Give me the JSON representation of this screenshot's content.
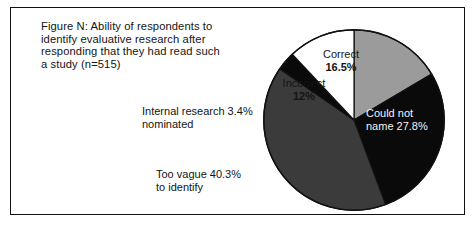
{
  "figure": {
    "title_lines": [
      "Figure N: Ability of respondents to",
      "identify evaluative research after",
      "responding that they had read such",
      "a study (n=515)"
    ]
  },
  "chart_data": {
    "type": "pie",
    "title": "Figure N: Ability of respondents to identify evaluative research after responding that they had read such a study (n=515)",
    "total_respondents": 515,
    "start_angle_deg": 0,
    "direction": "clockwise",
    "legend": "none",
    "categories": [
      "Correct",
      "Could not name",
      "Too vague to identify",
      "Internal research nominated",
      "Incorrect"
    ],
    "values": [
      16.5,
      27.8,
      40.3,
      3.4,
      12
    ],
    "unit": "%",
    "colors": [
      "#9b9b9b",
      "#0a0a0a",
      "#3b3b3b",
      "#0a0a0a",
      "#ffffff"
    ],
    "slices": [
      {
        "name": "Correct",
        "value": 16.5,
        "label_line1": "Correct",
        "label_line2": "16.5%",
        "color": "#9b9b9b",
        "text_color": "#141414",
        "label_placement": "inside"
      },
      {
        "name": "Could not name",
        "value": 27.8,
        "label_line1": "Could not",
        "label_line2": "name 27.8%",
        "color": "#0a0a0a",
        "text_color": "#f2f2f2",
        "label_placement": "inside"
      },
      {
        "name": "Too vague to identify",
        "value": 40.3,
        "label_line1": "Too vague 40.3%",
        "label_line2": "to identify",
        "color": "#3b3b3b",
        "text_color": "#141414",
        "label_placement": "outside-left"
      },
      {
        "name": "Internal research nominated",
        "value": 3.4,
        "label_line1": "Internal research 3.4%",
        "label_line2": "nominated",
        "color": "#0a0a0a",
        "text_color": "#141414",
        "label_placement": "outside-left"
      },
      {
        "name": "Incorrect",
        "value": 12,
        "label_line1": "Incorrect",
        "label_line2": "12%",
        "color": "#ffffff",
        "text_color": "#141414",
        "label_placement": "inside"
      }
    ]
  }
}
